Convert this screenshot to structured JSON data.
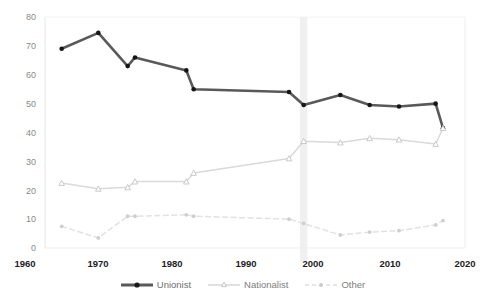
{
  "chart_data": {
    "type": "line",
    "title": "",
    "subtitle": "",
    "xlabel": "",
    "ylabel": "",
    "xlim": [
      1960,
      2020
    ],
    "ylim": [
      0,
      80
    ],
    "xticks": [
      1960,
      1970,
      1980,
      1990,
      2000,
      2010,
      2020
    ],
    "yticks": [
      0,
      10,
      20,
      30,
      40,
      50,
      60,
      70,
      80
    ],
    "grid": false,
    "legend_position": "bottom",
    "x": [
      1965,
      1970,
      1974,
      1975,
      1982,
      1983,
      1996,
      1998,
      2003,
      2007,
      2011,
      2016,
      2017
    ],
    "series": [
      {
        "name": "Unionist",
        "color": "#595959",
        "marker": "circle",
        "linestyle": "solid",
        "values": [
          69,
          74.5,
          63,
          66,
          61.5,
          55,
          54,
          49.5,
          53,
          49.5,
          49,
          50,
          41.5
        ]
      },
      {
        "name": "Nationalist",
        "color": "#d9d9d9",
        "marker": "triangle",
        "linestyle": "solid",
        "values": [
          22.5,
          20.5,
          21,
          23,
          23,
          26,
          31,
          37,
          36.5,
          38,
          37.5,
          36,
          41.5
        ]
      },
      {
        "name": "Other",
        "color": "#e2e2e2",
        "marker": "circle",
        "linestyle": "dashed",
        "values": [
          7.5,
          3.5,
          11,
          11,
          11.5,
          11,
          10,
          8.5,
          4.5,
          5.5,
          6,
          8,
          9.5
        ]
      }
    ],
    "highlight_band": {
      "label": "1998",
      "x_start": 1997.5,
      "x_end": 1998.5,
      "color": "#f0f0f0"
    }
  },
  "axes": {
    "y_tick_labels": [
      "80",
      "70",
      "60",
      "50",
      "40",
      "30",
      "20",
      "10",
      "0"
    ],
    "x_tick_labels": [
      "1960",
      "1970",
      "1980",
      "1990",
      "2000",
      "2010",
      "2020"
    ]
  },
  "legend": {
    "items": [
      {
        "label": "Unionist",
        "color": "#595959",
        "style": "solid",
        "marker": "circle"
      },
      {
        "label": "Nationalist",
        "color": "#d5d5d5",
        "style": "solid",
        "marker": "triangle"
      },
      {
        "label": "Other",
        "color": "#dcdcdc",
        "style": "dashed",
        "marker": "circle"
      }
    ]
  }
}
